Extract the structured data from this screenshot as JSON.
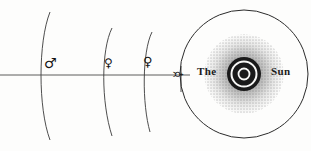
{
  "figure": {
    "title_words": {
      "the": "The",
      "sun": "Sun"
    },
    "background_color": "#fdfdfc",
    "ink_color": "#1b1b1b",
    "width": 311,
    "height": 151
  },
  "celestial_bodies": [
    {
      "name": "Mars",
      "symbol_name": "mars-symbol",
      "glyph": "♂",
      "x": 44,
      "y": 56,
      "orbit_label": "mars-orbit-arc"
    },
    {
      "name": "Earth",
      "symbol_name": "earth-symbol",
      "glyph": "♀",
      "x": 104,
      "y": 57,
      "orbit_label": "earth-orbit-arc"
    },
    {
      "name": "Venus",
      "symbol_name": "venus-symbol",
      "glyph": "♀",
      "x": 143,
      "y": 55,
      "orbit_label": "venus-orbit-arc"
    },
    {
      "name": "Mercury",
      "symbol_name": "mercury-symbol",
      "glyph": "☿",
      "x": 172,
      "y": 78,
      "orbit_label": "mercury-orbit-arc",
      "rotated": true
    }
  ],
  "sun": {
    "outer_circle": {
      "cx": 244,
      "cy": 74,
      "r": 64
    },
    "corona_radius": 40,
    "disc_radius": 17,
    "core_radius": 9,
    "ray_count": 44
  },
  "baseline": {
    "y": 75,
    "x_start": 0,
    "x_end": 190
  }
}
